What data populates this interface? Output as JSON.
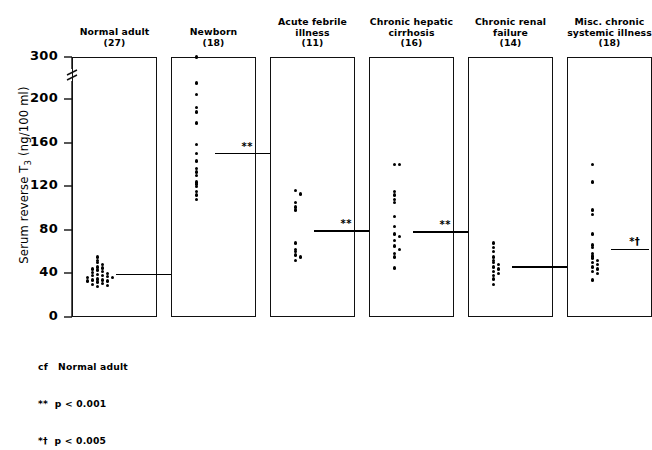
{
  "chart_data": {
    "type": "scatter",
    "title": "",
    "ylabel": "Serum reverse T3 (ng/100 ml)",
    "xlabel": "",
    "ylim": [
      0,
      300
    ],
    "yticks": [
      0,
      40,
      80,
      120,
      160,
      200,
      300
    ],
    "ytick_labels": [
      "0",
      "40",
      "80",
      "120",
      "160",
      "200",
      "300"
    ],
    "axis_break": {
      "between": [
        200,
        300
      ],
      "present": true
    },
    "grid": false,
    "legend_position": "bottom-left",
    "groups": [
      {
        "label": "Normal adult",
        "n_label": "(27)",
        "n": 27,
        "values": [
          55,
          52,
          50,
          48,
          46,
          45,
          44,
          43,
          42,
          41,
          40,
          39,
          38,
          38,
          37,
          36,
          36,
          35,
          34,
          34,
          33,
          33,
          32,
          31,
          30,
          29,
          28
        ],
        "mean": 39,
        "significance": ""
      },
      {
        "label": "Newborn",
        "n_label": "(18)",
        "n": 18,
        "values": [
          300,
          238,
          210,
          192,
          188,
          178,
          158,
          150,
          143,
          136,
          133,
          130,
          124,
          122,
          120,
          115,
          112,
          108
        ],
        "mean": 150,
        "significance": "**"
      },
      {
        "label": "Acute febrile illness",
        "n_label": "(11)",
        "n": 11,
        "values": [
          116,
          113,
          105,
          101,
          98,
          68,
          62,
          60,
          57,
          55,
          52
        ],
        "mean": 79,
        "significance": "**"
      },
      {
        "label": "Chronic hepatic cirrhosis",
        "n_label": "(16)",
        "n": 16,
        "values": [
          140,
          140,
          115,
          112,
          108,
          105,
          92,
          83,
          76,
          74,
          70,
          65,
          62,
          58,
          55,
          45
        ],
        "mean": 78,
        "significance": "**"
      },
      {
        "label": "Chronic renal failure",
        "n_label": "(14)",
        "n": 14,
        "values": [
          68,
          64,
          60,
          55,
          52,
          50,
          48,
          46,
          44,
          42,
          40,
          38,
          35,
          30
        ],
        "mean": 46,
        "significance": ""
      },
      {
        "label": "Misc. chronic systemic illness",
        "n_label": "(18)",
        "n": 18,
        "values": [
          140,
          124,
          98,
          94,
          76,
          66,
          64,
          58,
          56,
          54,
          52,
          50,
          48,
          46,
          44,
          42,
          40,
          34
        ],
        "mean": 62,
        "significance": "*†"
      }
    ],
    "footnote": [
      "cf   Normal adult",
      "**  p < 0.001",
      "*†  p < 0.005"
    ]
  },
  "colors": {
    "ink": "#000000",
    "background": "#ffffff"
  }
}
